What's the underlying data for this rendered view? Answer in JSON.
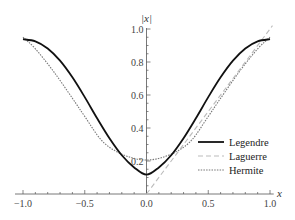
{
  "chart_data": {
    "type": "line",
    "title": "",
    "xlabel": "x",
    "ylabel": "|x|",
    "xlim": [
      -1.0,
      1.0
    ],
    "ylim": [
      0.0,
      1.0
    ],
    "x_ticks": [
      "-1.0",
      "-0.5",
      "0.0",
      "0.5",
      "1.0"
    ],
    "x_tick_values": [
      -1.0,
      -0.5,
      0.0,
      0.5,
      1.0
    ],
    "y_ticks": [
      "0.2",
      "0.4",
      "0.6",
      "0.8",
      "1.0"
    ],
    "y_tick_values": [
      0.2,
      0.4,
      0.6,
      0.8,
      1.0
    ],
    "grid": false,
    "legend_position": "bottom-right",
    "series": [
      {
        "name": "Legendre",
        "style": "solid",
        "color": "#111111",
        "x": [
          -1.0,
          -0.9,
          -0.8,
          -0.7,
          -0.6,
          -0.5,
          -0.4,
          -0.3,
          -0.2,
          -0.1,
          0.0,
          0.1,
          0.2,
          0.3,
          0.4,
          0.5,
          0.6,
          0.7,
          0.8,
          0.9,
          1.0
        ],
        "values": [
          0.938,
          0.925,
          0.882,
          0.808,
          0.707,
          0.587,
          0.459,
          0.338,
          0.235,
          0.161,
          0.117,
          0.161,
          0.235,
          0.338,
          0.459,
          0.587,
          0.707,
          0.808,
          0.882,
          0.925,
          0.938
        ]
      },
      {
        "name": "Laguerre",
        "style": "dashed",
        "color": "#bbbbbb",
        "x": [
          0.0,
          1.02
        ],
        "values": [
          0.0,
          1.02
        ]
      },
      {
        "name": "Hermite",
        "style": "dotted",
        "color": "#777777",
        "x": [
          -1.0,
          -0.9,
          -0.75,
          -0.6,
          -0.5,
          -0.37,
          -0.25,
          -0.12,
          0.0,
          0.12,
          0.25,
          0.37,
          0.5,
          0.6,
          0.75,
          0.9,
          1.0
        ],
        "values": [
          0.95,
          0.88,
          0.74,
          0.58,
          0.47,
          0.33,
          0.26,
          0.22,
          0.206,
          0.22,
          0.26,
          0.33,
          0.47,
          0.58,
          0.74,
          0.88,
          0.95
        ]
      }
    ]
  }
}
